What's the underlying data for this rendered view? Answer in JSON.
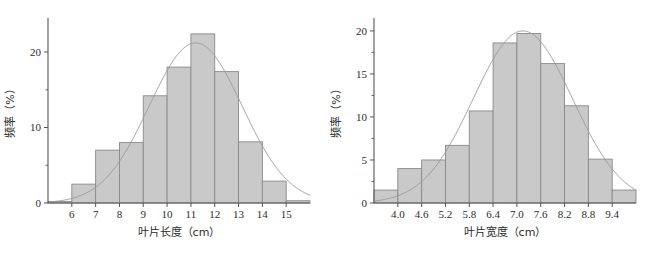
{
  "figure": {
    "background": "#ffffff",
    "bar_fill": "#c9c9c9",
    "bar_stroke": "#8a8a8a",
    "axis_color": "#555555",
    "curve_color": "#9a9a9a",
    "text_color": "#2b2b2b"
  },
  "chart_data": [
    {
      "type": "bar",
      "id": "leaf-length-histogram",
      "title": "",
      "xlabel": "叶片长度（cm）",
      "ylabel": "频率（%）",
      "xlim": [
        5.0,
        16.0
      ],
      "ylim": [
        0,
        24.5
      ],
      "xticks": [
        "6",
        "7",
        "8",
        "9",
        "10",
        "11",
        "12",
        "13",
        "14",
        "15"
      ],
      "xtick_values": [
        6,
        7,
        8,
        9,
        10,
        11,
        12,
        13,
        14,
        15
      ],
      "yticks": [
        "0",
        "10",
        "20"
      ],
      "ytick_values": [
        0,
        10,
        20
      ],
      "yminor_values": [
        5,
        15
      ],
      "grid": false,
      "legend": "none",
      "bin_width": 1.0,
      "bin_starts": [
        5.0,
        6.0,
        7.0,
        8.0,
        9.0,
        10.0,
        11.0,
        12.0,
        13.0,
        14.0,
        15.0
      ],
      "categories": [
        "5-6",
        "6-7",
        "7-8",
        "8-9",
        "9-10",
        "10-11",
        "11-12",
        "12-13",
        "13-14",
        "14-15",
        "15-16"
      ],
      "values": [
        0.2,
        2.5,
        7.0,
        8.0,
        14.2,
        18.0,
        22.4,
        17.4,
        8.1,
        2.9,
        0.3
      ],
      "overlay_curve": {
        "name": "normal-fit",
        "type": "line",
        "mean": 11.2,
        "sigma": 1.95,
        "peak": 21.2
      }
    },
    {
      "type": "bar",
      "id": "leaf-width-histogram",
      "title": "",
      "xlabel": "叶片宽度（cm）",
      "ylabel": "频率（%）",
      "xlim": [
        3.4,
        10.0
      ],
      "ylim": [
        0,
        21.5
      ],
      "xticks": [
        "4.0",
        "4.6",
        "5.2",
        "5.8",
        "6.4",
        "7.0",
        "7.6",
        "8.2",
        "8.8",
        "9.4"
      ],
      "xtick_values": [
        4.0,
        4.6,
        5.2,
        5.8,
        6.4,
        7.0,
        7.6,
        8.2,
        8.8,
        9.4
      ],
      "yticks": [
        "0",
        "5",
        "10",
        "15",
        "20"
      ],
      "ytick_values": [
        0,
        5,
        10,
        15,
        20
      ],
      "yminor_values": [
        2.5,
        7.5,
        12.5,
        17.5
      ],
      "grid": false,
      "legend": "none",
      "bin_width": 0.6,
      "bin_starts": [
        3.4,
        4.0,
        4.6,
        5.2,
        5.8,
        6.4,
        7.0,
        7.6,
        8.2,
        8.8,
        9.4
      ],
      "categories": [
        "3.4-4.0",
        "4.0-4.6",
        "4.6-5.2",
        "5.2-5.8",
        "5.8-6.4",
        "6.4-7.0",
        "7.0-7.6",
        "7.6-8.2",
        "8.2-8.8",
        "8.8-9.4",
        "9.4-10.0"
      ],
      "values": [
        1.5,
        4.0,
        5.0,
        6.7,
        10.7,
        18.6,
        19.7,
        16.2,
        11.3,
        5.1,
        1.5
      ],
      "overlay_curve": {
        "name": "normal-fit",
        "type": "line",
        "mean": 7.15,
        "sigma": 1.25,
        "peak": 20.0
      }
    }
  ]
}
